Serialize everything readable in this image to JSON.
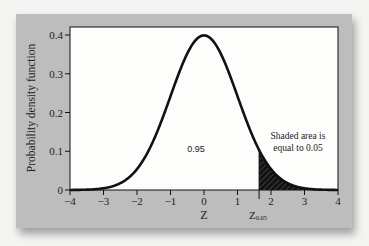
{
  "chart_data": {
    "type": "line",
    "title": "",
    "xlabel": "Z",
    "ylabel": "Probability density function",
    "xlim": [
      -4,
      4
    ],
    "ylim": [
      0,
      0.4
    ],
    "x_ticks": [
      "-4",
      "-3",
      "-2",
      "-1",
      "0",
      "1",
      "2",
      "3",
      "4"
    ],
    "y_ticks": [
      "0",
      "0.1",
      "0.2",
      "0.3",
      "0.4"
    ],
    "series": [
      {
        "name": "Standard normal density",
        "function": "N(0,1) pdf",
        "peak": {
          "x": 0,
          "y": 0.399
        }
      }
    ],
    "shaded_region": {
      "from": 1.645,
      "to": 4,
      "area": 0.05
    },
    "annotations": {
      "center_area": "0.95",
      "shaded_note_line1": "Shaded area is",
      "shaded_note_line2": "equal to 0.05",
      "critical_value_label": "Z",
      "critical_value_subscript": "0.05"
    },
    "grid": false,
    "legend": "none"
  }
}
